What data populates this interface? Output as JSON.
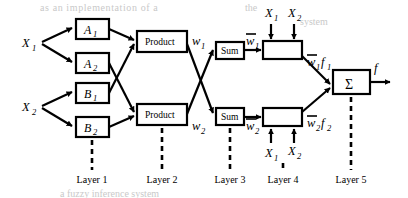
{
  "figure": {
    "type": "anfis-architecture-diagram",
    "background_color": "#ffffff",
    "line_color": "#000000"
  },
  "inputs": [
    {
      "id": "x1-left",
      "label": "X",
      "sub": "1"
    },
    {
      "id": "x2-left",
      "label": "X",
      "sub": "2"
    }
  ],
  "layer1": {
    "name": "Layer 1",
    "nodes": [
      {
        "id": "a1",
        "label": "A",
        "sub": "1"
      },
      {
        "id": "a2",
        "label": "A",
        "sub": "2"
      },
      {
        "id": "b1",
        "label": "B",
        "sub": "1"
      },
      {
        "id": "b2",
        "label": "B",
        "sub": "2"
      }
    ]
  },
  "layer2": {
    "name": "Layer 2",
    "nodes": [
      {
        "id": "product-top",
        "label": "Product"
      },
      {
        "id": "product-bottom",
        "label": "Product"
      }
    ],
    "outputs": [
      {
        "id": "w1",
        "label": "w",
        "sub": "1"
      },
      {
        "id": "w2",
        "label": "w",
        "sub": "2"
      }
    ]
  },
  "layer3": {
    "name": "Layer 3",
    "nodes": [
      {
        "id": "sum-top",
        "label": "Sum"
      },
      {
        "id": "sum-bottom",
        "label": "Sum"
      }
    ],
    "outputs": [
      {
        "id": "wbar1",
        "label": "w",
        "sub": "1",
        "overbar": true
      },
      {
        "id": "wbar2",
        "label": "w",
        "sub": "2",
        "overbar": true
      }
    ]
  },
  "layer4": {
    "name": "Layer 4",
    "nodes": [
      {
        "id": "node-f1",
        "label": ""
      },
      {
        "id": "node-f2",
        "label": ""
      }
    ],
    "top_inputs": [
      {
        "id": "x1-top",
        "label": "X",
        "sub": "1"
      },
      {
        "id": "x2-top",
        "label": "X",
        "sub": "2"
      }
    ],
    "bottom_inputs": [
      {
        "id": "x1-bottom",
        "label": "X",
        "sub": "1"
      },
      {
        "id": "x2-bottom",
        "label": "X",
        "sub": "2"
      }
    ],
    "outputs": [
      {
        "id": "wbar1f1",
        "w": "w",
        "wsub": "1",
        "f": "f",
        "fsub": "1"
      },
      {
        "id": "wbar2f2",
        "w": "w",
        "wsub": "2",
        "f": "f",
        "fsub": "2"
      }
    ]
  },
  "layer5": {
    "name": "Layer 5",
    "nodes": [
      {
        "id": "sigma",
        "label": "Σ"
      }
    ],
    "output": {
      "id": "f-out",
      "label": "f"
    }
  },
  "layer_labels": [
    {
      "id": "layer-1",
      "text": "Layer 1"
    },
    {
      "id": "layer-2",
      "text": "Layer 2"
    },
    {
      "id": "layer-3",
      "text": "Layer 3"
    },
    {
      "id": "layer-4",
      "text": "Layer 4"
    },
    {
      "id": "layer-5",
      "text": "Layer 5"
    }
  ],
  "ghost_text": [
    {
      "id": "ghost-top-1",
      "text": "as an implementation of a"
    },
    {
      "id": "ghost-top-2",
      "text": "the"
    },
    {
      "id": "ghost-top-3",
      "text": "system"
    },
    {
      "id": "ghost-bottom-1",
      "text": "a fuzzy inference system"
    }
  ]
}
